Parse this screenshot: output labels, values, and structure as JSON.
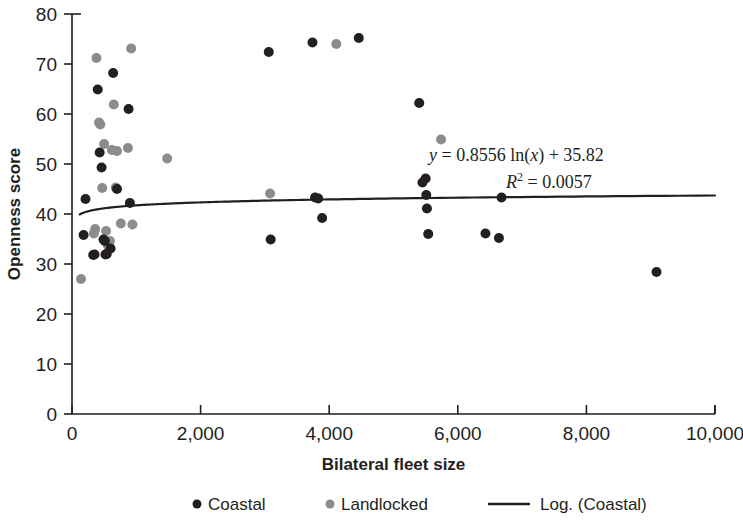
{
  "chart_data": {
    "type": "scatter",
    "title": "",
    "xlabel": "Bilateral fleet size",
    "ylabel": "Openness score",
    "xlim": [
      0,
      10000
    ],
    "ylim": [
      0,
      80
    ],
    "xticks": [
      "0",
      "2,000",
      "4,000",
      "6,000",
      "8,000",
      "10,000"
    ],
    "xtick_values": [
      0,
      2000,
      4000,
      6000,
      8000,
      10000
    ],
    "yticks": [
      "0",
      "10",
      "20",
      "30",
      "40",
      "50",
      "60",
      "70",
      "80"
    ],
    "ytick_values": [
      0,
      10,
      20,
      30,
      40,
      50,
      60,
      70,
      80
    ],
    "grid": false,
    "legend_position": "bottom",
    "series": [
      {
        "name": "Coastal",
        "marker": "circle",
        "color": "#231f20",
        "points": [
          [
            180,
            35.8
          ],
          [
            210,
            43.0
          ],
          [
            330,
            31.8
          ],
          [
            350,
            31.9
          ],
          [
            400,
            64.9
          ],
          [
            430,
            52.3
          ],
          [
            460,
            49.3
          ],
          [
            490,
            34.9
          ],
          [
            510,
            34.6
          ],
          [
            520,
            31.9
          ],
          [
            540,
            32.0
          ],
          [
            600,
            33.1
          ],
          [
            640,
            68.2
          ],
          [
            700,
            45.0
          ],
          [
            880,
            61.0
          ],
          [
            900,
            42.2
          ],
          [
            3060,
            72.4
          ],
          [
            3090,
            34.9
          ],
          [
            3740,
            74.3
          ],
          [
            3780,
            43.3
          ],
          [
            3830,
            43.1
          ],
          [
            3890,
            39.2
          ],
          [
            4460,
            75.2
          ],
          [
            5400,
            62.2
          ],
          [
            5450,
            46.3
          ],
          [
            5500,
            47.1
          ],
          [
            5510,
            43.8
          ],
          [
            5520,
            41.1
          ],
          [
            5540,
            36.0
          ],
          [
            6430,
            36.1
          ],
          [
            6640,
            35.2
          ],
          [
            6680,
            43.3
          ],
          [
            9090,
            28.4
          ]
        ]
      },
      {
        "name": "Landlocked",
        "marker": "circle",
        "color": "#8c8c8c",
        "points": [
          [
            140,
            27.0
          ],
          [
            340,
            36.1
          ],
          [
            360,
            37.0
          ],
          [
            380,
            71.2
          ],
          [
            420,
            58.3
          ],
          [
            440,
            57.9
          ],
          [
            470,
            45.2
          ],
          [
            500,
            54.0
          ],
          [
            530,
            36.6
          ],
          [
            560,
            33.7
          ],
          [
            590,
            34.6
          ],
          [
            620,
            52.8
          ],
          [
            650,
            61.9
          ],
          [
            680,
            45.3
          ],
          [
            700,
            52.6
          ],
          [
            760,
            38.1
          ],
          [
            870,
            53.2
          ],
          [
            920,
            73.1
          ],
          [
            940,
            37.9
          ],
          [
            1480,
            51.1
          ],
          [
            3080,
            44.1
          ],
          [
            4110,
            74.0
          ],
          [
            5740,
            54.9
          ]
        ]
      }
    ],
    "trendline": {
      "name": "Log. (Coastal)",
      "type": "logarithmic",
      "equation": "y = 0.8556 ln(x) + 35.82",
      "equation_y_prefix": "y",
      "equation_y_body": " = 0.8556 ln(",
      "equation_y_var": "x",
      "equation_y_suffix": ") + 35.82",
      "r_squared_label": "R",
      "r_squared_exponent": "2",
      "r_squared_value": " = 0.0057",
      "r_squared": 0.0057,
      "slope": 0.8556,
      "intercept": 35.82,
      "color": "#231f20",
      "x_start": 120,
      "x_end": 10000
    },
    "legend": [
      {
        "label": "Coastal",
        "marker": "dot",
        "color": "#231f20"
      },
      {
        "label": "Landlocked",
        "marker": "dot",
        "color": "#8c8c8c"
      },
      {
        "label": "Log. (Coastal)",
        "marker": "line",
        "color": "#231f20"
      }
    ]
  }
}
